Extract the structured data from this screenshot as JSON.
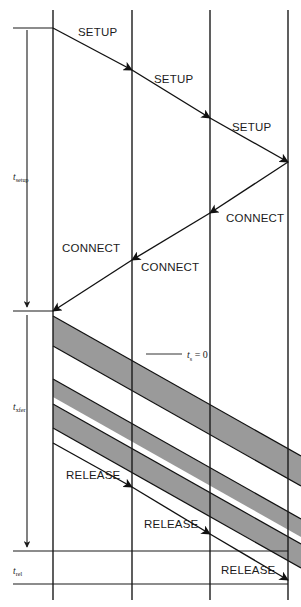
{
  "diagram": {
    "type": "sequence-timing",
    "canvas": {
      "width": 301,
      "height": 607
    },
    "colors": {
      "line": "#1b1b1b",
      "band_fill": "#9a9a9a",
      "background": "#ffffff"
    },
    "timelines": [
      {
        "name": "timeline-1",
        "x": 53
      },
      {
        "name": "timeline-2",
        "x": 132
      },
      {
        "name": "timeline-3",
        "x": 210
      },
      {
        "name": "timeline-4",
        "x": 288
      }
    ],
    "messages": [
      {
        "label": "SETUP",
        "from_x": 53,
        "from_y": 28,
        "to_x": 132,
        "to_y": 70,
        "text_x": 78,
        "text_y": 36
      },
      {
        "label": "SETUP",
        "from_x": 132,
        "from_y": 70,
        "to_x": 210,
        "to_y": 118,
        "text_x": 154,
        "text_y": 83
      },
      {
        "label": "SETUP",
        "from_x": 210,
        "from_y": 118,
        "to_x": 288,
        "to_y": 162,
        "text_x": 232,
        "text_y": 131
      },
      {
        "label": "CONNECT",
        "from_x": 288,
        "from_y": 162,
        "to_x": 210,
        "to_y": 213,
        "text_x": 226,
        "text_y": 222
      },
      {
        "label": "CONNECT",
        "from_x": 210,
        "from_y": 213,
        "to_x": 132,
        "to_y": 260,
        "text_x": 140,
        "text_y": 271
      },
      {
        "label": "CONNECT",
        "from_x": 132,
        "from_y": 260,
        "to_x": 53,
        "to_y": 311,
        "text_x": 64,
        "text_y": 252
      },
      {
        "label": "RELEASE",
        "from_x": 53,
        "from_y": 443,
        "to_x": 132,
        "to_y": 487,
        "text_x": 67,
        "text_y": 479
      },
      {
        "label": "RELEASE",
        "from_x": 132,
        "from_y": 487,
        "to_x": 210,
        "to_y": 534,
        "text_x": 145,
        "text_y": 528
      },
      {
        "label": "RELEASE",
        "from_x": 210,
        "from_y": 534,
        "to_x": 288,
        "to_y": 580,
        "text_x": 222,
        "text_y": 574
      }
    ],
    "intervals": [
      {
        "name": "t-setup",
        "symbol": "t",
        "subscript": "setup",
        "top_y": 28,
        "bottom_y": 311,
        "label_y": 178
      },
      {
        "name": "t-xfer",
        "symbol": "t",
        "subscript": "xfer",
        "top_y": 311,
        "bottom_y": 551,
        "label_y": 408
      },
      {
        "name": "t-rel",
        "symbol": "t",
        "subscript": "rel",
        "top_y": 551,
        "bottom_y": 584,
        "label_y": 573
      }
    ],
    "annotation": {
      "name": "ts-zero",
      "symbol": "t",
      "subscript": "s",
      "equals": "= 0",
      "text_x": 188,
      "text_y": 357,
      "leader_from_x": 146,
      "leader_to_x": 182,
      "leader_y": 354
    },
    "data_bands": [
      {
        "name": "band-1",
        "left_top_y": 316,
        "thickness": 30
      },
      {
        "name": "band-2",
        "left_top_y": 379,
        "thickness": 18
      },
      {
        "name": "band-3",
        "left_top_y": 404,
        "thickness": 24
      }
    ],
    "band_slope_dx": 248,
    "band_slope_dy": 140
  }
}
